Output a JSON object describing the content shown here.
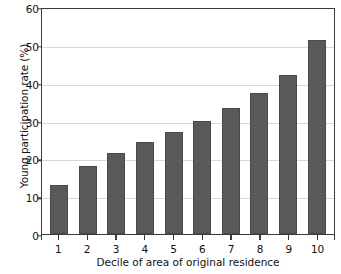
{
  "chart_data": {
    "type": "bar",
    "title": "",
    "xlabel": "Decile of area of original residence",
    "ylabel": "Young participation rate (%)",
    "categories": [
      "1",
      "2",
      "3",
      "4",
      "5",
      "6",
      "7",
      "8",
      "9",
      "10"
    ],
    "values": [
      13.0,
      18.0,
      21.5,
      24.3,
      27.0,
      30.0,
      33.4,
      37.3,
      42.1,
      51.2
    ],
    "ylim": [
      0,
      60
    ],
    "yticks": [
      0,
      10,
      20,
      30,
      40,
      50,
      60
    ],
    "ytick_labels": [
      "0",
      "10",
      "20",
      "30",
      "40",
      "50",
      "60"
    ],
    "grid": true,
    "grid_axis": "y",
    "legend": "none",
    "bar_color": "#595959",
    "series": [
      {
        "name": "Young participation rate",
        "values": [
          13.0,
          18.0,
          21.5,
          24.3,
          27.0,
          30.0,
          33.4,
          37.3,
          42.1,
          51.2
        ]
      }
    ]
  }
}
